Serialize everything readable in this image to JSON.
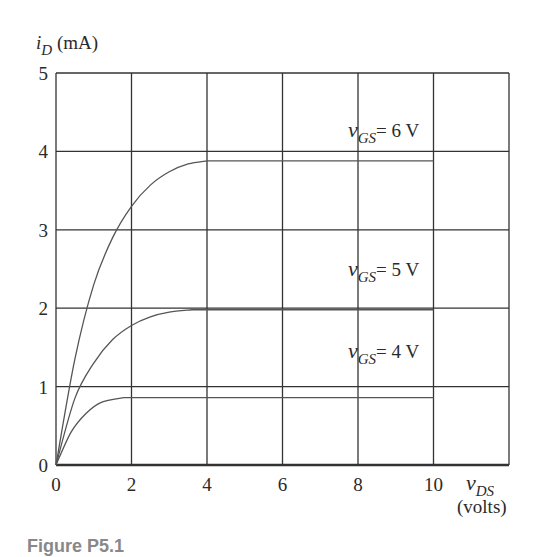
{
  "chart_data": {
    "type": "line",
    "title": "",
    "xlabel": "v_DS (volts)",
    "ylabel": "i_D (mA)",
    "xlim": [
      0,
      12
    ],
    "ylim": [
      0,
      5
    ],
    "x_ticks": [
      0,
      2,
      4,
      6,
      8,
      10
    ],
    "y_ticks": [
      0,
      1,
      2,
      3,
      4,
      5
    ],
    "grid": true,
    "series": [
      {
        "name": "v_GS = 6 V",
        "label_text": "= 6 V",
        "x": [
          0,
          0.5,
          1,
          1.5,
          2,
          2.5,
          3,
          3.5,
          4,
          10
        ],
        "y": [
          0,
          1.35,
          2.3,
          2.9,
          3.3,
          3.57,
          3.74,
          3.84,
          3.88,
          3.88
        ]
      },
      {
        "name": "v_GS = 5 V",
        "label_text": "= 5 V",
        "x": [
          0,
          0.5,
          1,
          1.5,
          2,
          2.5,
          3,
          3.6,
          10
        ],
        "y": [
          0,
          0.85,
          1.3,
          1.6,
          1.78,
          1.89,
          1.95,
          1.98,
          1.98
        ]
      },
      {
        "name": "v_GS = 4 V",
        "label_text": "= 4 V",
        "x": [
          0,
          0.4,
          0.8,
          1.2,
          1.8,
          10
        ],
        "y": [
          0,
          0.42,
          0.66,
          0.8,
          0.86,
          0.86
        ]
      }
    ],
    "annotations": [
      "v_GS = 6 V",
      "v_GS = 5 V",
      "v_GS = 4 V"
    ],
    "legend": "none (inline curve labels)"
  },
  "axes": {
    "y_label_main": "i",
    "y_label_sub": "D",
    "y_label_unit": " (mA)",
    "x_label_main": "v",
    "x_label_sub": "DS",
    "x_label_unit": "(volts)"
  },
  "curve_labels": {
    "v": "v",
    "sub": "GS",
    "six": "= 6 V",
    "five": "= 5 V",
    "four": "= 4 V"
  },
  "caption": "Figure P5.1"
}
